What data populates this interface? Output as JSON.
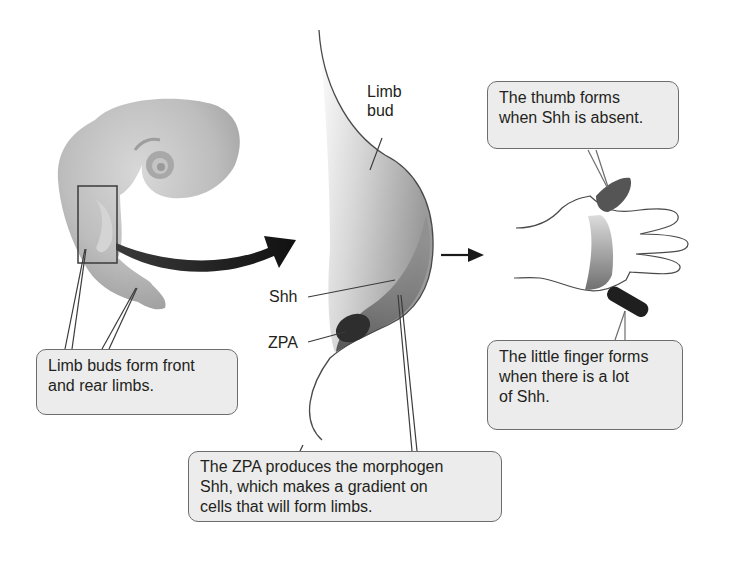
{
  "diagram": {
    "type": "limb development morphogen gradient illustration",
    "labels": {
      "limb_bud": [
        "Limb",
        "bud"
      ],
      "shh": "Shh",
      "zpa": "ZPA"
    },
    "callouts": {
      "limb_buds": [
        "Limb buds form front",
        "and rear limbs."
      ],
      "zpa_produces": [
        "The ZPA produces the morphogen",
        "Shh, which makes a gradient on",
        "cells that will form limbs."
      ],
      "thumb": [
        "The thumb forms",
        "when Shh is absent."
      ],
      "little_finger": [
        "The little finger forms",
        "when there is a lot",
        "of Shh."
      ]
    },
    "colors": {
      "callout_fill": "#ececec",
      "callout_border": "#6d6d6d",
      "embryo": "#b9b9b9",
      "gradient_dark": "#6a6a6a",
      "zpa": "#2e2e2e",
      "arrow": "#1a1a1a"
    }
  }
}
